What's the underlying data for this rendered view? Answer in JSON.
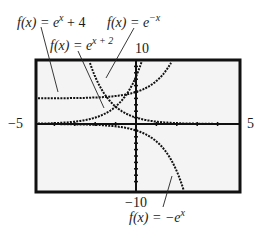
{
  "chart_data": {
    "type": "line",
    "title": "",
    "xlabel": "",
    "ylabel": "",
    "xlim": [
      -5,
      5
    ],
    "ylim": [
      -10,
      10
    ],
    "grid": false,
    "tick_labels": {
      "xmin": "−5",
      "xmax": "5",
      "ymax": "10",
      "ymin": "−10"
    },
    "series": [
      {
        "name": "f(x) = e^x + 4",
        "label_pre": "f(x) = e",
        "label_sup": "x",
        "label_post": " + 4",
        "expr": "exp(x)+4",
        "x": [
          -5,
          -4,
          -3,
          -2,
          -1,
          0,
          1,
          1.5,
          1.79
        ],
        "y": [
          4.01,
          4.02,
          4.05,
          4.14,
          4.37,
          5,
          6.72,
          8.48,
          10
        ]
      },
      {
        "name": "f(x) = e^(x+2)",
        "label_pre": "f(x) = e",
        "label_sup": "x + 2",
        "label_post": "",
        "expr": "exp(x+2)",
        "x": [
          -5,
          -4,
          -3,
          -2,
          -1,
          0,
          0.3
        ],
        "y": [
          0.05,
          0.14,
          0.37,
          1,
          2.72,
          7.39,
          9.97
        ]
      },
      {
        "name": "f(x) = e^(-x)",
        "label_pre": "f(x) = e",
        "label_sup": "−x",
        "label_post": "",
        "expr": "exp(-x)",
        "x": [
          -2.3,
          -2,
          -1,
          0,
          1,
          2,
          3,
          4,
          5
        ],
        "y": [
          9.97,
          7.39,
          2.72,
          1,
          0.37,
          0.14,
          0.05,
          0.02,
          0.01
        ]
      },
      {
        "name": "f(x) = -e^x",
        "label_pre": "f(x) = −e",
        "label_sup": "x",
        "label_post": "",
        "expr": "-exp(x)",
        "x": [
          -5,
          -3,
          -2,
          -1,
          0,
          1,
          1.5,
          2,
          2.3
        ],
        "y": [
          -0.01,
          -0.05,
          -0.14,
          -0.37,
          -1,
          -2.72,
          -4.48,
          -7.39,
          -9.97
        ]
      }
    ]
  },
  "layout": {
    "box": {
      "left": 36,
      "top": 60,
      "right": 240,
      "bottom": 192
    },
    "origin": {
      "x": 136,
      "y": 124
    },
    "scale": {
      "x": 20.4,
      "y": 6.4
    }
  }
}
